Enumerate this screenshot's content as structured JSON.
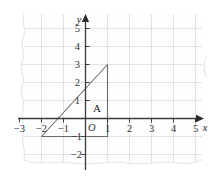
{
  "figure": {
    "background_color": "#ffffff",
    "grid_color": "#d8d8d8",
    "axis_color": "#3a3a3a",
    "shape_color": "#6b6b6b",
    "paper_edge_color": "#e2e2e2"
  },
  "axes": {
    "x_axis_name": "x",
    "y_axis_name": "y",
    "origin_label": "O",
    "x_ticks": [
      {
        "value": -3,
        "label": "−3"
      },
      {
        "value": -2,
        "label": "−2"
      },
      {
        "value": -1,
        "label": "−1"
      },
      {
        "value": 1,
        "label": "1"
      },
      {
        "value": 2,
        "label": "2"
      },
      {
        "value": 3,
        "label": "3"
      },
      {
        "value": 4,
        "label": "4"
      },
      {
        "value": 5,
        "label": "5"
      }
    ],
    "y_ticks": [
      {
        "value": 5,
        "label": "5"
      },
      {
        "value": 4,
        "label": "4"
      },
      {
        "value": 3,
        "label": "3"
      },
      {
        "value": 2,
        "label": "2"
      },
      {
        "value": 1,
        "label": "1"
      },
      {
        "value": -1,
        "label": "−1"
      },
      {
        "value": -2,
        "label": "−2"
      }
    ],
    "x_range": [
      -3.6,
      5.9
    ],
    "y_range": [
      -2.4,
      5.8
    ]
  },
  "shapes": [
    {
      "name": "triangle-A",
      "label": "A",
      "label_position": {
        "x": 0.35,
        "y": 0.55
      },
      "vertices": [
        {
          "x": -2,
          "y": -1
        },
        {
          "x": 1,
          "y": -1
        },
        {
          "x": 1,
          "y": 3
        }
      ]
    }
  ]
}
